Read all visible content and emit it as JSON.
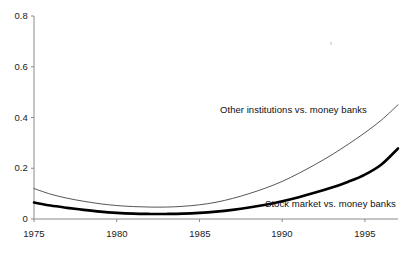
{
  "chart_data": {
    "type": "line",
    "title": "",
    "subtitle": "",
    "xlabel": "",
    "ylabel": "",
    "xlim": [
      1975,
      1997
    ],
    "ylim": [
      0,
      0.8
    ],
    "grid": false,
    "legend_position": "inline-annotations",
    "x_ticks": [
      "1975",
      "1980",
      "1985",
      "1990",
      "1995"
    ],
    "x_tick_values": [
      1975,
      1980,
      1985,
      1990,
      1995
    ],
    "y_ticks": [
      "0",
      "0.2",
      "0.4",
      "0.6",
      "0.8"
    ],
    "y_tick_values": [
      0,
      0.2,
      0.4,
      0.6,
      0.8
    ],
    "x": [
      1975,
      1976,
      1977,
      1978,
      1979,
      1980,
      1981,
      1982,
      1983,
      1984,
      1985,
      1986,
      1987,
      1988,
      1989,
      1990,
      1991,
      1992,
      1993,
      1994,
      1995,
      1996,
      1997
    ],
    "series": [
      {
        "name": "Other institutions vs. money banks",
        "style": "thin",
        "color": "#2b2b2b",
        "linewidth": 0.8,
        "values": [
          0.12,
          0.098,
          0.082,
          0.07,
          0.06,
          0.053,
          0.049,
          0.047,
          0.047,
          0.05,
          0.056,
          0.066,
          0.081,
          0.1,
          0.122,
          0.148,
          0.18,
          0.215,
          0.253,
          0.295,
          0.34,
          0.39,
          0.45
        ]
      },
      {
        "name": "Stock market vs. money banks",
        "style": "thick",
        "color": "#000000",
        "linewidth": 2.6,
        "values": [
          0.065,
          0.053,
          0.044,
          0.036,
          0.029,
          0.024,
          0.021,
          0.02,
          0.02,
          0.021,
          0.024,
          0.029,
          0.036,
          0.045,
          0.056,
          0.07,
          0.086,
          0.104,
          0.124,
          0.147,
          0.175,
          0.215,
          0.278
        ]
      }
    ],
    "annotations": [
      {
        "text": "Other institutions vs. money banks",
        "series": "Other institutions vs. money banks"
      },
      {
        "text": "Stock market vs. money banks",
        "series": "Stock market vs. money banks"
      }
    ]
  },
  "axes": {
    "y_tick_labels": [
      "0.8",
      "0.6",
      "0.4",
      "0.2",
      "0"
    ],
    "x_tick_labels": [
      "1975",
      "1980",
      "1985",
      "1990",
      "1995"
    ]
  },
  "annotations": {
    "other_institutions": "Other institutions vs. money banks",
    "stock_market": "Stock market vs. money banks"
  },
  "colors": {
    "axis": "#8a8a8a",
    "thin_line": "#2b2b2b",
    "thick_line": "#000000",
    "text": "#1a1a1a",
    "background": "#ffffff"
  }
}
